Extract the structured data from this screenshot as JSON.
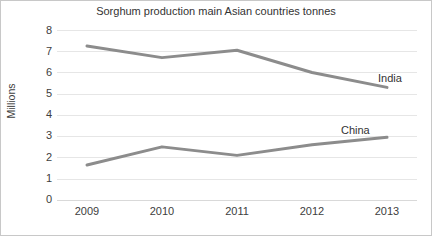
{
  "chart_data": {
    "type": "line",
    "title": "Sorghum production main Asian countries tonnes",
    "xlabel": "",
    "ylabel": "Millions",
    "categories": [
      "2009",
      "2010",
      "2011",
      "2012",
      "2013"
    ],
    "x_tick_labels": [
      "2009",
      "2010",
      "2011",
      "2012",
      "2013"
    ],
    "y_tick_labels": [
      "8",
      "7",
      "6",
      "5",
      "4",
      "3",
      "2",
      "1",
      "0"
    ],
    "ylim": [
      0,
      8
    ],
    "y_ticks": [
      0,
      1,
      2,
      3,
      4,
      5,
      6,
      7,
      8
    ],
    "grid": true,
    "grid_axis": "y",
    "legend": "inline-labels-right",
    "series": [
      {
        "name": "India",
        "label": "India",
        "color": "#8c8c8c",
        "values": [
          7.25,
          6.7,
          7.05,
          6.0,
          5.3
        ]
      },
      {
        "name": "China",
        "label": "China",
        "color": "#8c8c8c",
        "values": [
          1.65,
          2.5,
          2.1,
          2.6,
          2.95
        ]
      }
    ],
    "annotations": [
      {
        "text": "India",
        "series": "India"
      },
      {
        "text": "China",
        "series": "China"
      }
    ]
  },
  "colors": {
    "line": "#8c8c8c",
    "grid": "#e6e6e6",
    "text": "#404040",
    "title": "#333333",
    "background": "#ffffff",
    "border": "#c8c8c8"
  }
}
